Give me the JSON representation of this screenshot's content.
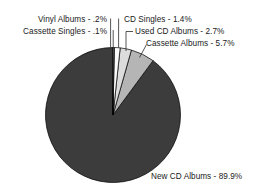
{
  "chart_data": {
    "type": "pie",
    "title": "",
    "subtitle": "",
    "xlabel": "",
    "ylabel": "",
    "legend_position": "none",
    "grid": false,
    "start_angle_deg": 0,
    "direction": "clockwise",
    "categories": [
      "Vinyl Albums",
      "Cassette Singles",
      "CD Singles",
      "Used CD Albums",
      "Cassette Albums",
      "New CD Albums"
    ],
    "values": [
      0.2,
      0.1,
      1.4,
      2.7,
      5.7,
      89.9
    ],
    "value_labels": [
      ".2%",
      ".1%",
      "1.4%",
      "2.7%",
      "5.7%",
      "89.9%"
    ],
    "colors": [
      "#f2f2f2",
      "#ffffff",
      "#fbfbfb",
      "#dcdcdc",
      "#b5b5b5",
      "#3c3c3c"
    ],
    "slices": [
      {
        "name": "Vinyl Albums",
        "value": 0.2,
        "value_label": ".2%",
        "color": "#f2f2f2",
        "label": "Vinyl Albums - .2%"
      },
      {
        "name": "Cassette Singles",
        "value": 0.1,
        "value_label": ".1%",
        "color": "#ffffff",
        "label": "Cassette Singles - .1%"
      },
      {
        "name": "CD Singles",
        "value": 1.4,
        "value_label": "1.4%",
        "color": "#fbfbfb",
        "label": "CD Singles - 1.4%"
      },
      {
        "name": "Used CD Albums",
        "value": 2.7,
        "value_label": "2.7%",
        "color": "#dcdcdc",
        "label": "Used CD Albums - 2.7%"
      },
      {
        "name": "Cassette Albums",
        "value": 5.7,
        "value_label": "5.7%",
        "color": "#b5b5b5",
        "label": "Cassette Albums - 5.7%"
      },
      {
        "name": "New CD Albums",
        "value": 89.9,
        "value_label": "89.9%",
        "color": "#3c3c3c",
        "label": "New CD Albums - 89.9%"
      }
    ]
  },
  "labels": {
    "vinyl_albums": "Vinyl Albums - .2%",
    "cassette_singles": "Cassette Singles - .1%",
    "cd_singles": "CD Singles - 1.4%",
    "used_cd_albums": "Used CD Albums - 2.7%",
    "cassette_albums": "Cassette Albums - 5.7%",
    "new_cd_albums": "New CD Albums - 89.9%"
  },
  "style": {
    "background": "#ffffff",
    "text_color": "#1a1a1a",
    "outline_color": "#000000"
  }
}
